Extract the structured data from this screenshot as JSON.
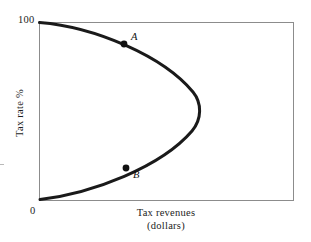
{
  "figure": {
    "name": "laffer-curve",
    "axes": {
      "box": {
        "left": 39,
        "top": 22,
        "right": 293,
        "bottom": 200
      },
      "frame_color": "#8c8c8c",
      "grid": false
    },
    "y_axis": {
      "title": "Tax rate %",
      "max_tick_label": "100",
      "min_tick_label": "0",
      "ticks": [
        "0",
        "100"
      ]
    },
    "x_axis": {
      "title_line1": "Tax revenues",
      "title_line2": "(dollars)",
      "ticks": []
    },
    "curve": {
      "color": "#1a1a1a",
      "stroke_width": 3.0,
      "path": "M 39.5 22.5 C 95 27 163 56 193 92 C 202 103 202 119 192 131 C 161 167 93 193 40 199.5"
    },
    "markers": [
      {
        "label": "A",
        "x": 124,
        "y": 44,
        "label_x": 131,
        "label_y": 31
      },
      {
        "label": "B",
        "x": 126,
        "y": 168,
        "label_x": 133,
        "label_y": 169
      }
    ]
  },
  "chart_data": {
    "type": "line",
    "title": "",
    "subtitle": "",
    "xlabel": "Tax revenues (dollars)",
    "ylabel": "Tax rate %",
    "xlim": [
      0,
      100
    ],
    "ylim": [
      0,
      100
    ],
    "grid": false,
    "legend": "none",
    "xticklabels": [],
    "yticklabels": [
      "0",
      "100"
    ],
    "series": [
      {
        "name": "Laffer curve",
        "description": "Backward-bending curve: tax revenue is zero at a 0% tax rate and at a 100% tax rate, rising to a maximum at an intermediate rate.",
        "x": [
          0,
          14,
          28,
          41,
          52,
          60,
          61,
          57,
          49,
          38,
          25,
          12,
          0
        ],
        "y": [
          100,
          97,
          91,
          82,
          71,
          59,
          50,
          41,
          30,
          21,
          13,
          6,
          0
        ]
      }
    ],
    "annotations": [
      {
        "label": "A",
        "x": 33,
        "y": 88,
        "note": "Point on the upper (high tax rate) branch of the curve"
      },
      {
        "label": "B",
        "x": 34,
        "y": 18,
        "note": "Point on the lower (low tax rate) branch yielding the same revenue as A"
      }
    ]
  }
}
